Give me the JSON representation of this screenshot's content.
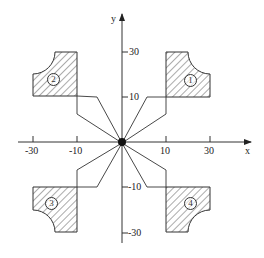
{
  "axes": {
    "x_label": "x",
    "y_label": "y",
    "x_ticks": [
      "-30",
      "-10",
      "10",
      "30"
    ],
    "y_ticks": [
      "30",
      "10",
      "-10",
      "-30"
    ]
  },
  "quadrants": [
    {
      "id": "1",
      "label": "①"
    },
    {
      "id": "2",
      "label": "②"
    },
    {
      "id": "3",
      "label": "③"
    },
    {
      "id": "4",
      "label": "④"
    }
  ],
  "colors": {
    "line": "#333333",
    "hatch": "#444444",
    "background": "#ffffff"
  }
}
